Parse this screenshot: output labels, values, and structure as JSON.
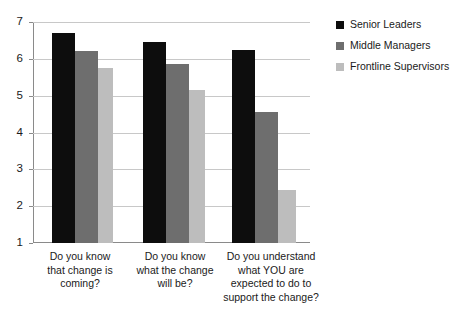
{
  "chart_data": {
    "type": "bar",
    "title": "",
    "xlabel": "",
    "ylabel": "",
    "ylim": [
      1,
      7
    ],
    "yticks": [
      1,
      2,
      3,
      4,
      5,
      6,
      7
    ],
    "ytick_labels": [
      "1",
      "2",
      "3",
      "4",
      "5",
      "6",
      "7"
    ],
    "grid": true,
    "legend_position": "right",
    "categories": [
      "Do you know that change is coming?",
      "Do you know what the change will be?",
      "Do you understand what YOU are expected to do to support the change?"
    ],
    "category_lines": [
      [
        "Do you know",
        "that change is",
        "coming?"
      ],
      [
        "Do you know",
        "what the change",
        "will be?"
      ],
      [
        "Do you understand",
        "what YOU are",
        "expected to do to",
        "support the change?"
      ]
    ],
    "series": [
      {
        "name": "Senior Leaders",
        "color": "#0d0d0d",
        "values": [
          6.7,
          6.45,
          6.25
        ]
      },
      {
        "name": "Middle Managers",
        "color": "#6e6e6e",
        "values": [
          6.2,
          5.85,
          4.55
        ]
      },
      {
        "name": "Frontline Supervisors",
        "color": "#bdbdbd",
        "values": [
          5.75,
          5.15,
          2.45
        ]
      }
    ]
  },
  "colors": {
    "senior_leaders": "#0d0d0d",
    "middle_managers": "#6e6e6e",
    "frontline_supervisors": "#bdbdbd",
    "gridline": "#c8c8c8",
    "axis": "#8a8a8a",
    "background": "#ffffff"
  }
}
